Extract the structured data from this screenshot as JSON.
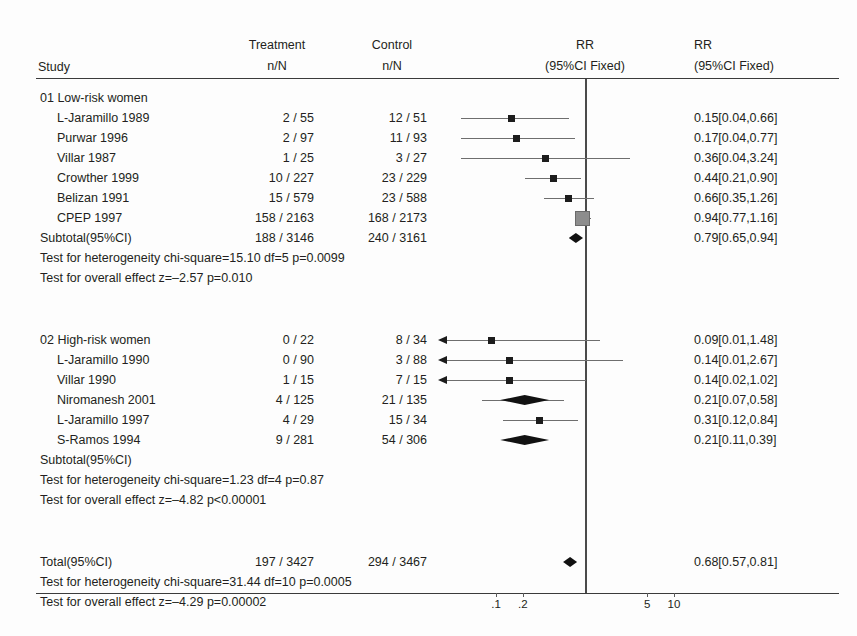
{
  "header": {
    "study": "Study",
    "treatment": "Treatment",
    "treatment_sub": "n/N",
    "control": "Control",
    "control_sub": "n/N",
    "rr_plot": "RR",
    "rr_plot_sub": "(95%CI Fixed)",
    "rr_text": "RR",
    "rr_text_sub": "(95%CI Fixed)"
  },
  "groups": [
    {
      "title": "01 Low-risk women",
      "rows": [
        {
          "label": "L-Jaramillo 1989",
          "treatment": "2 / 55",
          "control": "12 / 51",
          "rr": "0.15[0.04,0.66]"
        },
        {
          "label": "Purwar 1996",
          "treatment": "2 / 97",
          "control": "11 / 93",
          "rr": "0.17[0.04,0.77]"
        },
        {
          "label": "Villar 1987",
          "treatment": "1 / 25",
          "control": "3 / 27",
          "rr": "0.36[0.04,3.24]"
        },
        {
          "label": "Crowther 1999",
          "treatment": "10 / 227",
          "control": "23 / 229",
          "rr": "0.44[0.21,0.90]"
        },
        {
          "label": "Belizan 1991",
          "treatment": "15 / 579",
          "control": "23 / 588",
          "rr": "0.66[0.35,1.26]"
        },
        {
          "label": "CPEP 1997",
          "treatment": "158 / 2163",
          "control": "168 / 2173",
          "rr": "0.94[0.77,1.16]"
        }
      ],
      "subtotal": {
        "label": "Subtotal(95%CI)",
        "treatment": "188 / 3146",
        "control": "240 / 3161",
        "rr": "0.79[0.65,0.94]"
      },
      "heterogeneity": "Test for heterogeneity chi-square=15.10 df=5 p=0.0099",
      "overall_effect": "Test for overall effect z=–2.57 p=0.010"
    },
    {
      "title": "02 High-risk women",
      "title_treatment": "0 / 22",
      "title_control": "8 / 34",
      "title_rr": "0.09[0.01,1.48]",
      "rows": [
        {
          "label": "L-Jaramillo 1990",
          "treatment": "0 / 90",
          "control": "3 / 88",
          "rr": "0.14[0.01,2.67]"
        },
        {
          "label": "Villar 1990",
          "treatment": "1 / 15",
          "control": "7 / 15",
          "rr": "0.14[0.02,1.02]"
        },
        {
          "label": "Niromanesh 2001",
          "treatment": "4 / 125",
          "control": "21 / 135",
          "rr": "0.21[0.07,0.58]"
        },
        {
          "label": "L-Jaramillo 1997",
          "treatment": "4 / 29",
          "control": "15 / 34",
          "rr": "0.31[0.12,0.84]"
        },
        {
          "label": "S-Ramos 1994",
          "treatment": "9 / 281",
          "control": "54 / 306",
          "rr": "0.21[0.11,0.39]"
        }
      ],
      "subtotal": {
        "label": "Subtotal(95%CI)",
        "treatment": "",
        "control": "",
        "rr": ""
      },
      "heterogeneity": "Test for heterogeneity chi-square=1.23 df=4 p=0.87",
      "overall_effect": "Test for overall effect z=–4.82 p<0.00001"
    }
  ],
  "total": {
    "label": "Total(95%CI)",
    "treatment": "197 / 3427",
    "control": "294 / 3467",
    "rr": "0.68[0.57,0.81]",
    "heterogeneity": "Test for heterogeneity chi-square=31.44 df=10 p=0.0005",
    "overall_effect": "Test for overall effect  z=–4.29 p=0.00002"
  },
  "axis": {
    "type": "log",
    "ticks": [
      {
        "label": ".1",
        "value": 0.1
      },
      {
        "label": ".2",
        "value": 0.2
      },
      {
        "label": "5",
        "value": 5
      },
      {
        "label": "10",
        "value": 10
      }
    ],
    "reference_value": 1
  },
  "colors": {
    "text": "#231f20",
    "rule": "#3b3b3b",
    "marker": "#1c1c1c",
    "marker_large": "#8d8d8d",
    "ci": "#6e6e6e",
    "reference_line": "#4a4a4a"
  },
  "chart_data": {
    "type": "forest",
    "title": "",
    "effect_measure": "RR",
    "ci_model": "95%CI Fixed",
    "xscale": "log",
    "xlim": [
      0.05,
      20
    ],
    "reference_line": 1,
    "xticks": [
      0.1,
      0.2,
      5,
      10
    ],
    "xticklabels": [
      ".1",
      ".2",
      "5",
      "10"
    ],
    "entries": [
      {
        "group": "01 Low-risk women",
        "label": "L-Jaramillo 1989",
        "treat_n": 2,
        "treat_N": 55,
        "ctrl_n": 12,
        "ctrl_N": 51,
        "rr": 0.15,
        "lo": 0.04,
        "hi": 0.66,
        "kind": "study"
      },
      {
        "group": "01 Low-risk women",
        "label": "Purwar 1996",
        "treat_n": 2,
        "treat_N": 97,
        "ctrl_n": 11,
        "ctrl_N": 93,
        "rr": 0.17,
        "lo": 0.04,
        "hi": 0.77,
        "kind": "study"
      },
      {
        "group": "01 Low-risk women",
        "label": "Villar 1987",
        "treat_n": 1,
        "treat_N": 25,
        "ctrl_n": 3,
        "ctrl_N": 27,
        "rr": 0.36,
        "lo": 0.04,
        "hi": 3.24,
        "kind": "study"
      },
      {
        "group": "01 Low-risk women",
        "label": "Crowther 1999",
        "treat_n": 10,
        "treat_N": 227,
        "ctrl_n": 23,
        "ctrl_N": 229,
        "rr": 0.44,
        "lo": 0.21,
        "hi": 0.9,
        "kind": "study"
      },
      {
        "group": "01 Low-risk women",
        "label": "Belizan 1991",
        "treat_n": 15,
        "treat_N": 579,
        "ctrl_n": 23,
        "ctrl_N": 588,
        "rr": 0.66,
        "lo": 0.35,
        "hi": 1.26,
        "kind": "study"
      },
      {
        "group": "01 Low-risk women",
        "label": "CPEP 1997",
        "treat_n": 158,
        "treat_N": 2163,
        "ctrl_n": 168,
        "ctrl_N": 2173,
        "rr": 0.94,
        "lo": 0.77,
        "hi": 1.16,
        "kind": "study"
      },
      {
        "group": "01 Low-risk women",
        "label": "Subtotal(95%CI)",
        "treat_n": 188,
        "treat_N": 3146,
        "ctrl_n": 240,
        "ctrl_N": 3161,
        "rr": 0.79,
        "lo": 0.65,
        "hi": 0.94,
        "kind": "subtotal"
      },
      {
        "group": "02 High-risk women",
        "label": "02 High-risk women",
        "treat_n": 0,
        "treat_N": 22,
        "ctrl_n": 8,
        "ctrl_N": 34,
        "rr": 0.09,
        "lo": 0.01,
        "hi": 1.48,
        "kind": "study"
      },
      {
        "group": "02 High-risk women",
        "label": "L-Jaramillo 1990",
        "treat_n": 0,
        "treat_N": 90,
        "ctrl_n": 3,
        "ctrl_N": 88,
        "rr": 0.14,
        "lo": 0.01,
        "hi": 2.67,
        "kind": "study"
      },
      {
        "group": "02 High-risk women",
        "label": "Villar 1990",
        "treat_n": 1,
        "treat_N": 15,
        "ctrl_n": 7,
        "ctrl_N": 15,
        "rr": 0.14,
        "lo": 0.02,
        "hi": 1.02,
        "kind": "study"
      },
      {
        "group": "02 High-risk women",
        "label": "Niromanesh 2001",
        "treat_n": 4,
        "treat_N": 125,
        "ctrl_n": 21,
        "ctrl_N": 135,
        "rr": 0.21,
        "lo": 0.07,
        "hi": 0.58,
        "kind": "study"
      },
      {
        "group": "02 High-risk women",
        "label": "L-Jaramillo 1997",
        "treat_n": 4,
        "treat_N": 29,
        "ctrl_n": 15,
        "ctrl_N": 34,
        "rr": 0.31,
        "lo": 0.12,
        "hi": 0.84,
        "kind": "study"
      },
      {
        "group": "02 High-risk women",
        "label": "S-Ramos 1994",
        "treat_n": 9,
        "treat_N": 281,
        "ctrl_n": 54,
        "ctrl_N": 306,
        "rr": 0.21,
        "lo": 0.11,
        "hi": 0.39,
        "kind": "subtotal"
      },
      {
        "group": "Total",
        "label": "Total(95%CI)",
        "treat_n": 197,
        "treat_N": 3427,
        "ctrl_n": 294,
        "ctrl_N": 3467,
        "rr": 0.68,
        "lo": 0.57,
        "hi": 0.81,
        "kind": "total"
      }
    ]
  }
}
